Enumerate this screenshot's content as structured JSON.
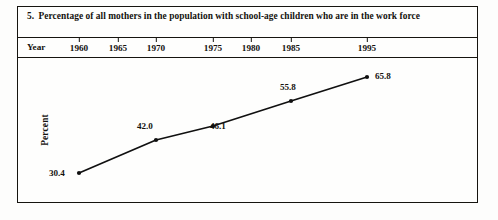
{
  "figure": {
    "number": "5.",
    "caption": "Percentage of all mothers in the population with school-age children who are in the work force"
  },
  "axis": {
    "year_label": "Year",
    "percent_label": "Percent"
  },
  "colors": {
    "ink": "#16140f",
    "paper": "#fdfdfc",
    "line": "#101010"
  },
  "chart_data": {
    "type": "line",
    "title": "Percentage of all mothers in the population with school-age children who are in the work force",
    "xlabel": "Year",
    "ylabel": "Percent",
    "grid": false,
    "legend": "none",
    "xlim": [
      1960,
      1995
    ],
    "ylim": [
      30.4,
      65.8
    ],
    "x_tick_labels": [
      "1960",
      "1965",
      "1970",
      "1975",
      "1980",
      "1985",
      "1995"
    ],
    "x_ticks": [
      1960,
      1965,
      1970,
      1975,
      1980,
      1985,
      1995
    ],
    "x": [
      1960,
      1970,
      1975,
      1985,
      1995
    ],
    "values": [
      30.4,
      42.0,
      46.1,
      55.8,
      65.8
    ],
    "point_labels": [
      "30.4",
      "42.0",
      "46.1",
      "55.8",
      "65.8"
    ],
    "series": [
      {
        "name": "Percent of mothers in work force",
        "x": [
          1960,
          1970,
          1975,
          1985,
          1995
        ],
        "values": [
          30.4,
          42.0,
          46.1,
          55.8,
          65.8
        ]
      }
    ]
  },
  "geometry": {
    "tick_x": {
      "1960": 78,
      "1965": 117,
      "1970": 155,
      "1975": 212,
      "1980": 250,
      "1985": 290,
      "1995": 366
    },
    "points": [
      {
        "label": "30.4",
        "px": 78,
        "py": 115,
        "lx": 48,
        "ly": 110
      },
      {
        "label": "42.0",
        "px": 155,
        "py": 82,
        "lx": 136,
        "ly": 63
      },
      {
        "label": "46.1",
        "px": 212,
        "py": 68,
        "lx": 209,
        "ly": 63
      },
      {
        "label": "55.8",
        "px": 290,
        "py": 43,
        "lx": 279,
        "ly": 24
      },
      {
        "label": "65.8",
        "px": 366,
        "py": 19,
        "lx": 374,
        "ly": 13
      }
    ]
  }
}
